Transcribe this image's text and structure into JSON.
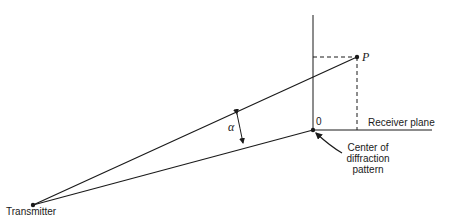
{
  "diagram": {
    "colors": {
      "ink": "#1a1a1a",
      "background": "#ffffff"
    },
    "labels": {
      "transmitter": "Transmitter",
      "point": "P",
      "origin": "0",
      "receiver_plane": "Receiver plane",
      "center_line1": "Center of",
      "center_line2": "diffraction",
      "center_line3": "pattern",
      "angle": "α"
    }
  }
}
